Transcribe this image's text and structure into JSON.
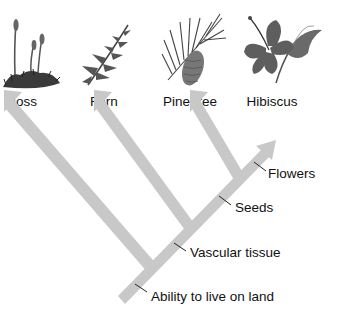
{
  "diagram": {
    "type": "cladogram",
    "colors": {
      "branch": "#c8c8c8",
      "text": "#111111",
      "tick": "#222222"
    },
    "taxa": [
      {
        "id": "moss",
        "label": "Moss",
        "icon": "moss-illustration"
      },
      {
        "id": "fern",
        "label": "Fern",
        "icon": "fern-illustration"
      },
      {
        "id": "pine",
        "label": "Pine tree",
        "icon": "pine-branch-illustration"
      },
      {
        "id": "hibiscus",
        "label": "Hibiscus",
        "icon": "hibiscus-flower-illustration"
      }
    ],
    "traits": [
      {
        "label": "Ability to live on land"
      },
      {
        "label": "Vascular tissue"
      },
      {
        "label": "Seeds"
      },
      {
        "label": "Flowers"
      }
    ]
  }
}
